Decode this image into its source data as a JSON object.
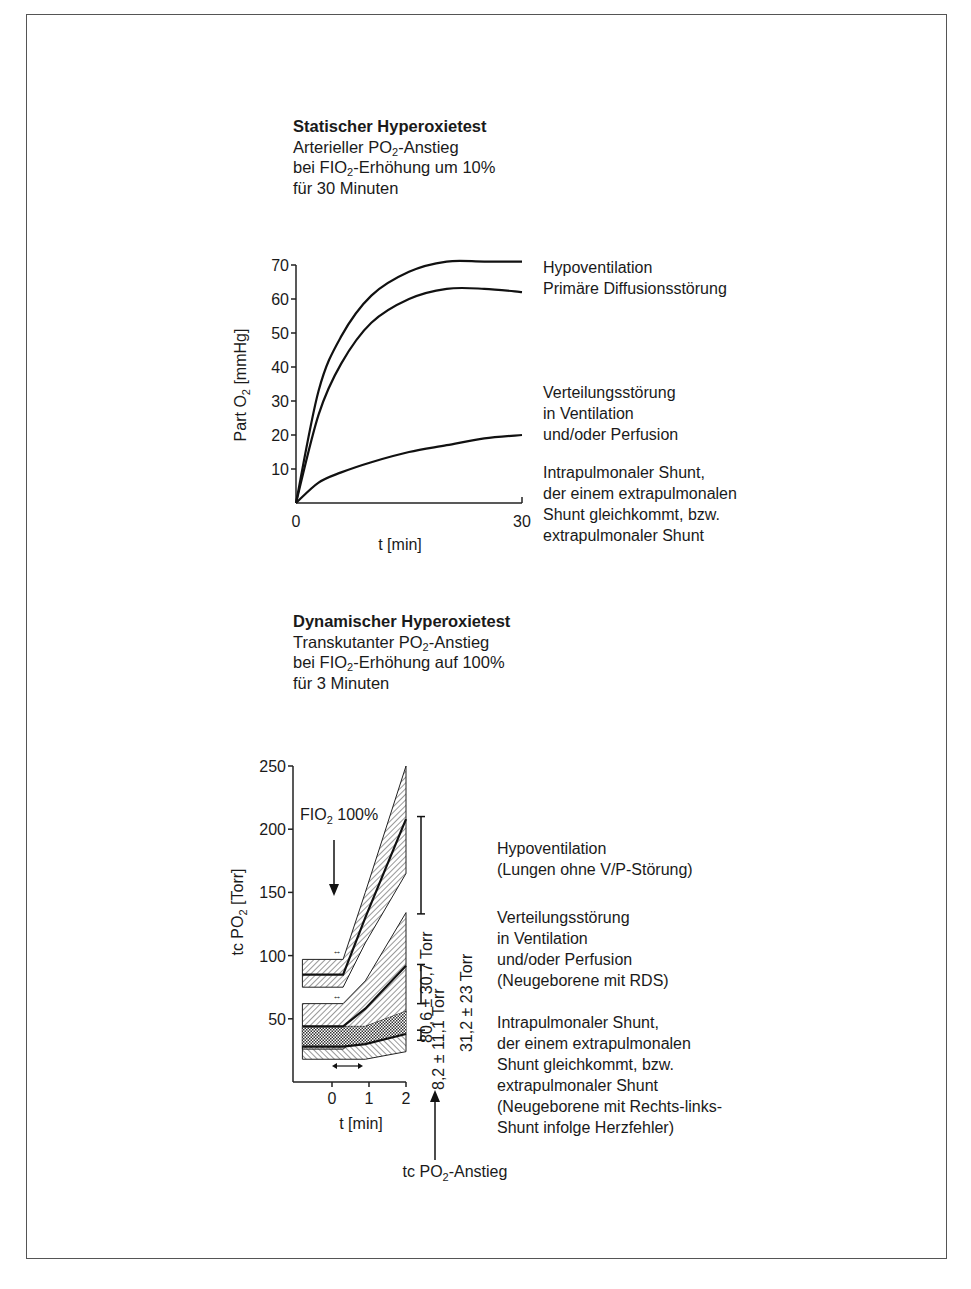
{
  "static_test": {
    "title": "Statischer Hyperoxietest",
    "line1_pre": "Arterieller PO",
    "line1_sub": "2",
    "line1_post": "-Anstieg",
    "line2_pre": "bei FIO",
    "line2_sub": "2",
    "line2_post": "-Erhöhung um 10%",
    "line3": "für 30 Minuten",
    "ylabel_pre": "Part O",
    "ylabel_sub": "2",
    "ylabel_post": " [mmHg]",
    "xlabel": "t [min]",
    "legend": {
      "a1": "Hypoventilation",
      "a2": "Primäre Diffusionsstörung",
      "b1": "Verteilungsstörung",
      "b2": "in Ventilation",
      "b3": "und/oder Perfusion",
      "c1": "Intrapulmonaler Shunt,",
      "c2": "der einem extrapulmonalen",
      "c3": "Shunt gleichkommt, bzw.",
      "c4": "extrapulmonaler Shunt"
    }
  },
  "dynamic_test": {
    "title": "Dynamischer Hyperoxietest",
    "line1_pre": "Transkutanter PO",
    "line1_sub": "2",
    "line1_post": "-Anstieg",
    "line2_pre": "bei FIO",
    "line2_sub": "2",
    "line2_post": "-Erhöhung auf 100%",
    "line3": "für 3 Minuten",
    "ylabel_pre": "tc PO",
    "ylabel_sub": "2",
    "ylabel_post": " [Torr]",
    "xlabel": "t [min]",
    "fio2_pre": "FIO",
    "fio2_sub": "2",
    "fio2_post": " 100%",
    "range1": "80,6 ± 30,7 Torr",
    "range2": "8,2 ± 11,1 Torr",
    "range3": "31,2 ± 23 Torr",
    "bottom_pre": "tc PO",
    "bottom_sub": "2",
    "bottom_post": "-Anstieg",
    "legend": {
      "a1": "Hypoventilation",
      "a2": "(Lungen ohne V/P-Störung)",
      "b1": "Verteilungsstörung",
      "b2": "in Ventilation",
      "b3": "und/oder Perfusion",
      "b4": "(Neugeborene mit RDS)",
      "c1": "Intrapulmonaler Shunt,",
      "c2": "der einem extrapulmonalen",
      "c3": "Shunt gleichkommt, bzw.",
      "c4": "extrapulmonaler Shunt",
      "c5": "(Neugeborene mit Rechts-links-",
      "c6": "Shunt infolge Herzfehler)"
    }
  },
  "chart_data": [
    {
      "type": "line",
      "title": "Statischer Hyperoxietest",
      "subtitle": "Arterieller PO2-Anstieg bei FIO2-Erhöhung um 10% für 30 Minuten",
      "xlabel": "t [min]",
      "ylabel": "Part O2 [mmHg]",
      "xlim": [
        0,
        30
      ],
      "ylim": [
        0,
        70
      ],
      "x_ticks": [
        "0",
        "30"
      ],
      "y_ticks": [
        "10",
        "20",
        "30",
        "40",
        "50",
        "60",
        "70"
      ],
      "grid": false,
      "legend_position": "right",
      "x": [
        0,
        3,
        6,
        10,
        15,
        20,
        25,
        30
      ],
      "series": [
        {
          "name": "Hypoventilation",
          "values": [
            0,
            33,
            49,
            61,
            68,
            71,
            71,
            71
          ]
        },
        {
          "name": "Primäre Diffusionsstörung",
          "values": [
            0,
            26,
            41,
            53,
            60,
            63,
            63,
            62
          ]
        },
        {
          "name": "Verteilungsstörung in Ventilation und/oder Perfusion / Intrapulmonaler Shunt",
          "values": [
            0,
            6,
            9,
            12,
            15,
            17,
            19,
            20
          ]
        }
      ]
    },
    {
      "type": "area",
      "title": "Dynamischer Hyperoxietest",
      "subtitle": "Transkutanter PO2-Anstieg bei FIO2-Erhöhung auf 100% für 3 Minuten",
      "xlabel": "t [min]",
      "ylabel": "tc PO2 [Torr]",
      "xlim": [
        -0.8,
        2
      ],
      "ylim": [
        0,
        250
      ],
      "x_ticks": [
        "0",
        "1",
        "2"
      ],
      "y_ticks": [
        "50",
        "100",
        "150",
        "200",
        "250"
      ],
      "grid": false,
      "annotations": [
        "FIO2 100%",
        "80,6 ± 30,7 Torr",
        "31,2 ± 23 Torr",
        "8,2 ± 11,1 Torr",
        "tc PO2-Anstieg"
      ],
      "x": [
        -0.8,
        0.3,
        0.9,
        2
      ],
      "series": [
        {
          "name": "Hypoventilation (mean)",
          "values": [
            85,
            85,
            130,
            208
          ],
          "band_low": [
            75,
            75,
            110,
            165
          ],
          "band_high": [
            97,
            97,
            150,
            250
          ]
        },
        {
          "name": "Verteilungsstörung (mean)",
          "values": [
            44,
            44,
            58,
            92
          ],
          "band_low": [
            26,
            26,
            40,
            55
          ],
          "band_high": [
            62,
            62,
            80,
            134
          ]
        },
        {
          "name": "Intrapulmonaler Shunt (mean)",
          "values": [
            28,
            28,
            30,
            38
          ],
          "band_low": [
            18,
            18,
            18,
            24
          ],
          "band_high": [
            44,
            44,
            44,
            56
          ]
        }
      ],
      "range_bars": [
        {
          "label": "80,6 ± 30,7 Torr",
          "low": 133,
          "high": 210
        },
        {
          "label": "31,2 ± 23 Torr",
          "low": 62,
          "high": 93
        },
        {
          "label": "8,2 ± 11,1 Torr",
          "low": 33,
          "high": 41
        }
      ]
    }
  ]
}
